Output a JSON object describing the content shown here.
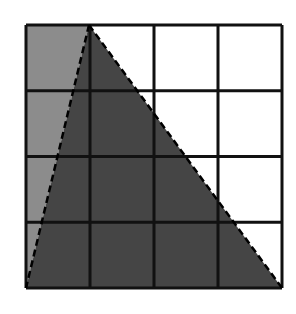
{
  "diagram": {
    "grid": {
      "rows": 4,
      "cols": 4,
      "left": 26,
      "top": 25,
      "right": 282,
      "bottom": 288,
      "line_color": "#111111"
    },
    "regions": [
      {
        "name": "left-column-strip",
        "fill": "#8c8c8c",
        "points": "26,25 89,25 26,288"
      },
      {
        "name": "shaded-triangle",
        "fill": "#454545",
        "points": "89,25 282,288 26,288"
      }
    ],
    "dashed_edges": [
      {
        "name": "left-triangle-edge",
        "x1": 89,
        "y1": 25,
        "x2": 26,
        "y2": 288
      },
      {
        "name": "right-triangle-edge",
        "x1": 89,
        "y1": 25,
        "x2": 282,
        "y2": 288
      }
    ],
    "colors": {
      "light_gray": "#8c8c8c",
      "dark_gray": "#454545",
      "white": "#ffffff",
      "line": "#111111"
    }
  }
}
